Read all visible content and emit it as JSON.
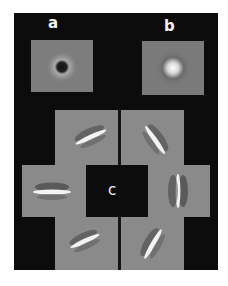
{
  "figure": {
    "panel_labels": {
      "a": "a",
      "b": "b",
      "c": "c"
    },
    "colors": {
      "background": "#0c0c0c",
      "tile_gray": "#8a8a8a",
      "label": "#f2f2f2"
    },
    "panel_a": {
      "description": "center-surround filter, dark center with bright ring"
    },
    "panel_b": {
      "description": "center-surround filter, bright center"
    },
    "panel_c": {
      "description": "oriented Gabor-like filters arranged around center",
      "orientations_deg": [
        -25,
        -55,
        0,
        90,
        -25,
        -60
      ]
    }
  }
}
